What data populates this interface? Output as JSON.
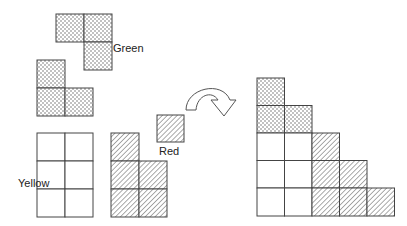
{
  "diagram": {
    "type": "polyomino-assembly",
    "cell_size": 27.5,
    "pieces": {
      "green": {
        "label": "Green",
        "pattern": "dots",
        "shapes": [
          {
            "name": "green-piece-1",
            "cells": [
              [
                0,
                0
              ],
              [
                1,
                0
              ],
              [
                1,
                1
              ]
            ]
          },
          {
            "name": "green-piece-2",
            "cells": [
              [
                0,
                0
              ],
              [
                0,
                1
              ],
              [
                1,
                1
              ]
            ]
          }
        ]
      },
      "yellow": {
        "label": "Yellow",
        "pattern": "blank",
        "shapes": [
          {
            "name": "yellow-piece",
            "cols": 2,
            "rows": 3
          }
        ]
      },
      "red": {
        "label": "Red",
        "pattern": "hatch",
        "shapes": [
          {
            "name": "red-piece-l",
            "cells": [
              [
                0,
                0
              ],
              [
                0,
                1
              ],
              [
                1,
                1
              ],
              [
                0,
                2
              ],
              [
                1,
                2
              ]
            ]
          },
          {
            "name": "red-piece-single",
            "cells": [
              [
                0,
                0
              ]
            ]
          }
        ]
      }
    },
    "arrow": {
      "name": "rotate-arrow",
      "direction": "clockwise-curved"
    },
    "result": {
      "name": "assembled-staircase",
      "rows": [
        [
          "green"
        ],
        [
          "green",
          "green"
        ],
        [
          "yellow",
          "yellow",
          "red"
        ],
        [
          "yellow",
          "yellow",
          "red",
          "red"
        ],
        [
          "yellow",
          "yellow",
          "red",
          "red",
          "red"
        ]
      ]
    }
  }
}
